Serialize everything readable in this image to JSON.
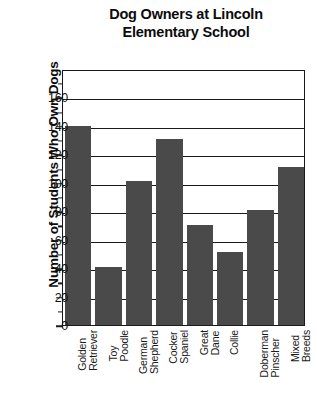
{
  "chart_data": {
    "type": "bar",
    "title": "Dog Owners at Lincoln Elementary School",
    "title_lines": [
      "Dog Owners at Lincoln",
      "Elementary School"
    ],
    "xlabel": "",
    "ylabel": "Number of Students Who Own Dogs",
    "categories": [
      "Golden Retriever",
      "Toy Poodle",
      "German Shepherd",
      "Cocker Spaniel",
      "Great Dane",
      "Collie",
      "Doberman Pinscher",
      "Mixed Breeds"
    ],
    "category_lines": [
      [
        "Golden",
        "Retriever"
      ],
      [
        "Toy",
        "Poodle"
      ],
      [
        "German",
        "Shepherd"
      ],
      [
        "Cocker",
        "Spaniel"
      ],
      [
        "Great",
        "Dane"
      ],
      [
        "Collie",
        ""
      ],
      [
        "Doberman",
        "Pinscher"
      ],
      [
        "Mixed",
        "Breeds"
      ]
    ],
    "values": [
      140,
      41,
      101,
      131,
      70,
      51,
      81,
      111
    ],
    "ylim": [
      0,
      180
    ],
    "ytick_values": [
      0,
      20,
      40,
      60,
      80,
      100,
      120,
      140,
      160
    ],
    "ytick_labels": [
      "0",
      "20",
      "40",
      "60",
      "80",
      "100",
      "120",
      "140",
      "160"
    ],
    "yminor_values": [
      10,
      30,
      50,
      70,
      90,
      110,
      130,
      150,
      170
    ],
    "gridline_values": [
      20,
      40,
      60,
      80,
      100,
      120,
      140,
      160
    ],
    "grid": true,
    "legend": false,
    "bar_color": "#4a4a4a",
    "axis_color": "#1a1a1a",
    "background": "#ffffff"
  }
}
